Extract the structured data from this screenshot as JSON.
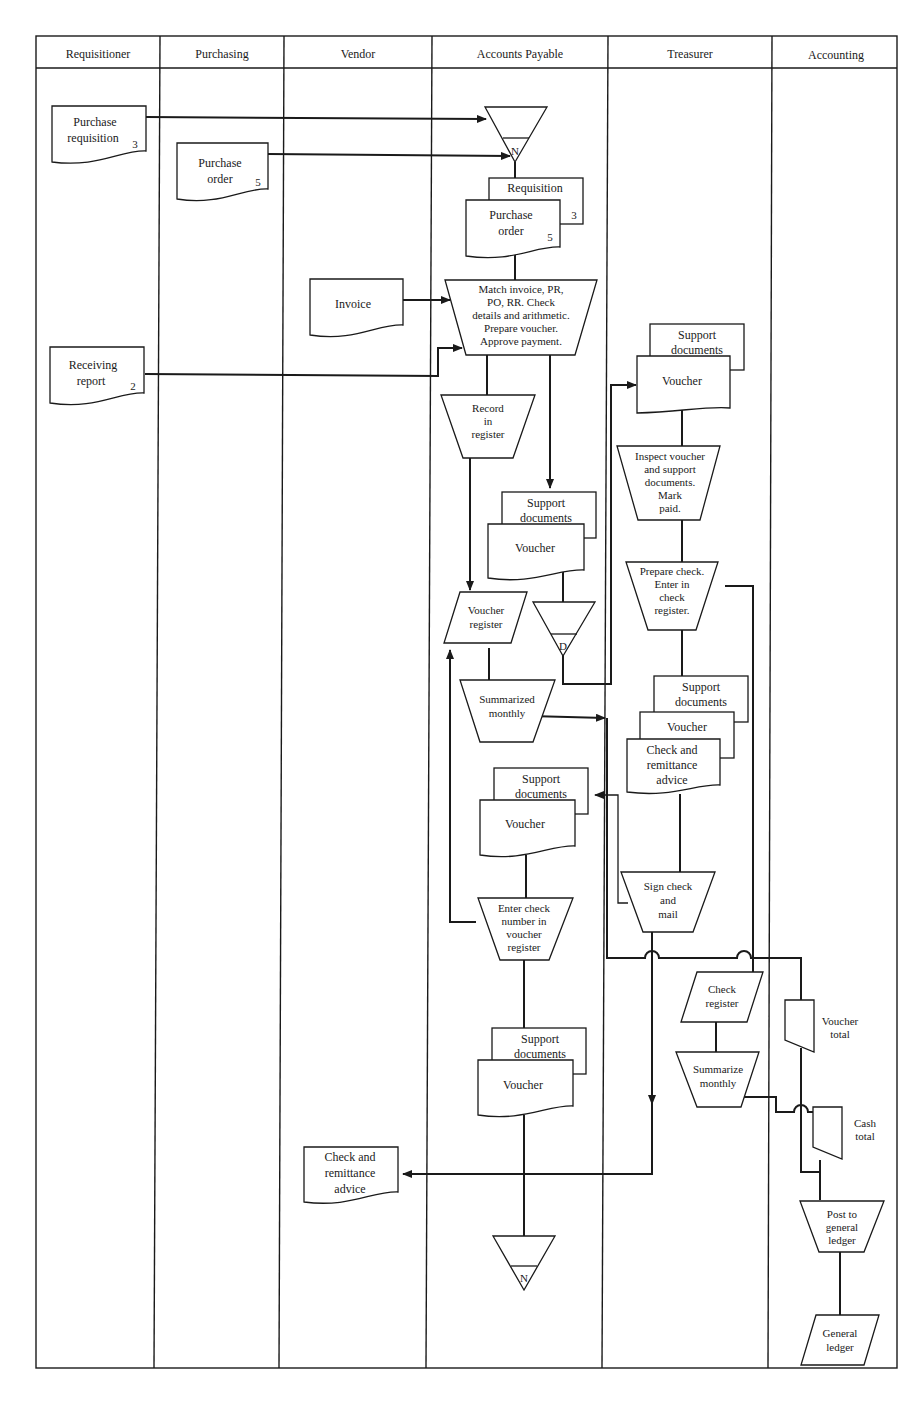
{
  "lanes": [
    {
      "name": "Requisitioner"
    },
    {
      "name": "Purchasing"
    },
    {
      "name": "Vendor"
    },
    {
      "name": "Accounts Payable"
    },
    {
      "name": "Treasurer"
    },
    {
      "name": "Accounting"
    }
  ],
  "requisitioner": {
    "purchase_requisition": {
      "l1": "Purchase",
      "l2": "requisition",
      "copy": "3"
    },
    "receiving_report": {
      "l1": "Receiving",
      "l2": "report",
      "copy": "2"
    }
  },
  "purchasing": {
    "purchase_order": {
      "l1": "Purchase",
      "l2": "order",
      "copy": "5"
    }
  },
  "vendor": {
    "invoice": {
      "label": "Invoice"
    },
    "check_advice": {
      "l1": "Check and",
      "l2": "remittance",
      "l3": "advice"
    }
  },
  "accounts_payable": {
    "file_top": {
      "letter": "N"
    },
    "requisition_doc": {
      "label": "Requisition",
      "copy": "3"
    },
    "po_doc": {
      "l1": "Purchase",
      "l2": "order",
      "copy": "5"
    },
    "match_process": {
      "l1": "Match invoice, PR,",
      "l2": "PO,  RR. Check",
      "l3": "details and arithmetic.",
      "l4": "Prepare voucher.",
      "l5": "Approve payment."
    },
    "record_process": {
      "l1": "Record",
      "l2": "in",
      "l3": "register"
    },
    "support_docs_1": {
      "l1": "Support",
      "l2": "documents"
    },
    "voucher_1": {
      "label": "Voucher"
    },
    "voucher_register": {
      "l1": "Voucher",
      "l2": "register"
    },
    "file_d": {
      "letter": "D"
    },
    "summarized_monthly": {
      "l1": "Summarized",
      "l2": "monthly"
    },
    "support_docs_2": {
      "l1": "Support",
      "l2": "documents"
    },
    "voucher_2": {
      "label": "Voucher"
    },
    "enter_check_number": {
      "l1": "Enter check",
      "l2": "number in",
      "l3": "voucher",
      "l4": "register"
    },
    "support_docs_3": {
      "l1": "Support",
      "l2": "documents"
    },
    "voucher_3": {
      "label": "Voucher"
    },
    "file_bottom": {
      "letter": "N"
    }
  },
  "treasurer": {
    "support_docs_1": {
      "l1": "Support",
      "l2": "documents"
    },
    "voucher_1": {
      "label": "Voucher"
    },
    "inspect_process": {
      "l1": "Inspect voucher",
      "l2": "and support",
      "l3": "documents.",
      "l4": "Mark",
      "l5": "paid."
    },
    "prepare_check": {
      "l1": "Prepare check.",
      "l2": "Enter in",
      "l3": "check",
      "l4": "register."
    },
    "support_docs_2": {
      "l1": "Support",
      "l2": "documents"
    },
    "voucher_2": {
      "label": "Voucher"
    },
    "check_advice": {
      "l1": "Check and",
      "l2": "remittance",
      "l3": "advice"
    },
    "sign_check": {
      "l1": "Sign check",
      "l2": "and",
      "l3": "mail"
    },
    "check_register": {
      "l1": "Check",
      "l2": "register"
    },
    "summarize_monthly": {
      "l1": "Summarize",
      "l2": "monthly"
    }
  },
  "accounting": {
    "voucher_total": {
      "l1": "Voucher",
      "l2": "total"
    },
    "cash_total": {
      "l1": "Cash",
      "l2": "total"
    },
    "post_gl": {
      "l1": "Post to",
      "l2": "general",
      "l3": "ledger"
    },
    "general_ledger": {
      "l1": "General",
      "l2": "ledger"
    }
  }
}
